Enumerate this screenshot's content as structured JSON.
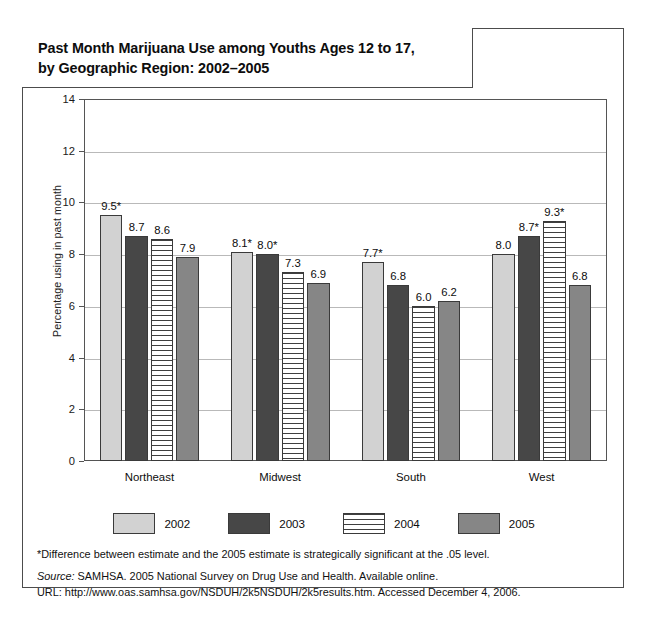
{
  "chart_data": {
    "type": "bar",
    "title": "Past Month Marijuana Use among Youths Ages 12 to 17,\nby Geographic Region: 2002–2005",
    "xlabel": "",
    "ylabel": "Percentage using in past month",
    "ylim": [
      0,
      14
    ],
    "yticks": [
      0,
      2,
      4,
      6,
      8,
      10,
      12,
      14
    ],
    "ytick_labels": [
      "0",
      "2",
      "4",
      "6",
      "8",
      "10",
      "12",
      "14"
    ],
    "grid": "horizontal",
    "legend_position": "bottom",
    "categories": [
      "Northeast",
      "Midwest",
      "South",
      "West"
    ],
    "series": [
      {
        "name": "2002",
        "color": "#d2d2d2",
        "values": [
          9.5,
          8.1,
          7.7,
          8.0
        ],
        "labels": [
          "9.5*",
          "8.1*",
          "7.7*",
          "8.0"
        ]
      },
      {
        "name": "2003",
        "color": "#474747",
        "values": [
          8.7,
          8.0,
          6.8,
          8.7
        ],
        "labels": [
          "8.7",
          "8.0*",
          "6.8",
          "8.7*"
        ]
      },
      {
        "name": "2004",
        "color": "#ffffff",
        "values": [
          8.6,
          7.3,
          6.0,
          9.3
        ],
        "labels": [
          "8.6",
          "7.3",
          "6.0",
          "9.3*"
        ]
      },
      {
        "name": "2005",
        "color": "#868686",
        "values": [
          7.9,
          6.9,
          6.2,
          6.8
        ],
        "labels": [
          "7.9",
          "6.9",
          "6.2",
          "6.8"
        ]
      }
    ]
  },
  "footnotes": {
    "significance": "*Difference between estimate and the 2005 estimate is strategically significant at the .05 level.",
    "source_prefix": "Source:",
    "source_text": " SAMHSA. 2005 National Survey on Drug Use and Health. Available online.",
    "url_line": "URL: http://www.oas.samhsa.gov/NSDUH/2k5NSDUH/2k5results.htm. Accessed December 4, 2006.",
    "copyright": "© Infobase Publishing"
  }
}
